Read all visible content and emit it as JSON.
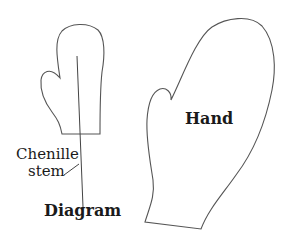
{
  "diagram": {
    "small_mitten": {
      "caption": "Diagram",
      "callout": {
        "line1": "Chenille",
        "line2": "stem"
      }
    },
    "large_mitten": {
      "label": "Hand"
    },
    "colors": {
      "outline": "#555555",
      "text": "#1a1a1a",
      "background": "#ffffff"
    }
  }
}
